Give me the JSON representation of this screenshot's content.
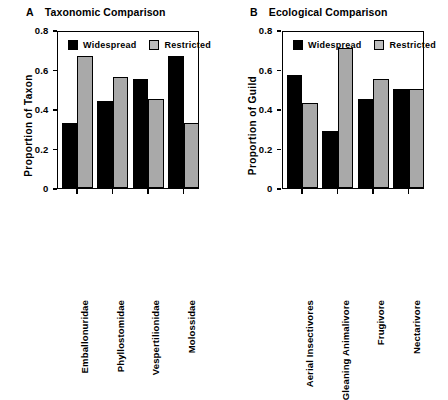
{
  "figure": {
    "background": "#ffffff",
    "colors": {
      "widespread": "#000000",
      "restricted": "#a9a9a9",
      "axis": "#000000"
    }
  },
  "panels": [
    {
      "letter": "A",
      "title": "Taxonomic Comparison",
      "ylabel": "Proportion of Taxon",
      "yticks": [
        "0.8",
        "0.6",
        "0.4",
        "0.2",
        "0"
      ],
      "legend": [
        {
          "label": "Widespread",
          "swatch": "black-square-swatch"
        },
        {
          "label": "Restricted",
          "swatch": "gray-square-swatch"
        }
      ]
    },
    {
      "letter": "B",
      "title": "Ecological Comparison",
      "ylabel": "Proportion of Guild",
      "yticks": [
        "0.8",
        "0.6",
        "0.4",
        "0.2",
        "0"
      ],
      "legend": [
        {
          "label": "Widespread",
          "swatch": "black-square-swatch"
        },
        {
          "label": "Restricted",
          "swatch": "gray-square-swatch"
        }
      ]
    }
  ],
  "chart_data": [
    {
      "type": "bar",
      "panel": "A",
      "title": "Taxonomic Comparison",
      "xlabel": "",
      "ylabel": "Proportion of Taxon",
      "ylim": [
        0,
        0.8
      ],
      "yticks": [
        0,
        0.2,
        0.4,
        0.6,
        0.8
      ],
      "grid": false,
      "legend_position": "inside-top-left",
      "categories": [
        "Emballonuridae",
        "Phyllostomidae",
        "Vespertilionidae",
        "Molossidae"
      ],
      "series": [
        {
          "name": "Widespread",
          "color": "#000000",
          "values": [
            0.33,
            0.44,
            0.55,
            0.67
          ]
        },
        {
          "name": "Restricted",
          "color": "#a9a9a9",
          "values": [
            0.67,
            0.56,
            0.45,
            0.33
          ]
        }
      ]
    },
    {
      "type": "bar",
      "panel": "B",
      "title": "Ecological Comparison",
      "xlabel": "",
      "ylabel": "Proportion of Guild",
      "ylim": [
        0,
        0.8
      ],
      "yticks": [
        0,
        0.2,
        0.4,
        0.6,
        0.8
      ],
      "grid": false,
      "legend_position": "inside-top-left",
      "categories": [
        "Aerial Insectivores",
        "Gleaning Animalivore",
        "Frugivore",
        "Nectarivore"
      ],
      "series": [
        {
          "name": "Widespread",
          "color": "#000000",
          "values": [
            0.57,
            0.29,
            0.45,
            0.5
          ]
        },
        {
          "name": "Restricted",
          "color": "#a9a9a9",
          "values": [
            0.43,
            0.71,
            0.55,
            0.5
          ]
        }
      ]
    }
  ]
}
